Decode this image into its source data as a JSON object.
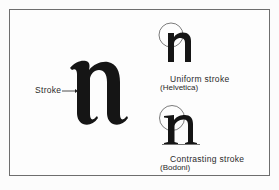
{
  "diagram": {
    "main_glyph": {
      "letter": "n",
      "style": "blackletter-serif"
    },
    "pointer_label": "Stroke",
    "examples": [
      {
        "caption": "Uniform stroke",
        "typeface": "(Helvetica)"
      },
      {
        "caption": "Contrasting stroke",
        "typeface": "(Bodoni)"
      }
    ],
    "colors": {
      "ink": "#151515",
      "border": "#6e6e6e",
      "background": "#fdfdfd"
    }
  }
}
